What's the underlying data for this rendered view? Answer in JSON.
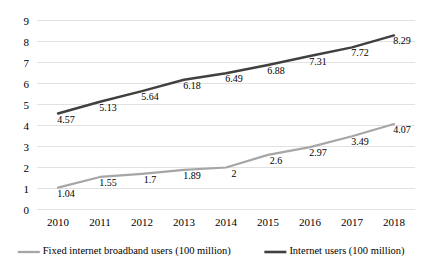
{
  "chart_data": {
    "type": "line",
    "title": "",
    "subtitle": "",
    "xlabel": "",
    "ylabel": "",
    "categories": [
      "2010",
      "2011",
      "2012",
      "2013",
      "2014",
      "2015",
      "2016",
      "2017",
      "2018"
    ],
    "ylim": [
      0,
      9
    ],
    "ytick_labels": [
      "0",
      "1",
      "2",
      "3",
      "4",
      "5",
      "6",
      "7",
      "8",
      "9"
    ],
    "ytick_values": [
      0,
      1,
      2,
      3,
      4,
      5,
      6,
      7,
      8,
      9
    ],
    "grid": "horizontal",
    "legend_position": "bottom",
    "series": [
      {
        "name": "Fixed internet broadband users (100 million)",
        "color": "#a6a6a6",
        "values": [
          1.04,
          1.55,
          1.7,
          1.89,
          2,
          2.6,
          2.97,
          3.49,
          4.07
        ],
        "labels": [
          "1.04",
          "1.55",
          "1.7",
          "1.89",
          "2",
          "2.6",
          "2.97",
          "3.49",
          "4.07"
        ]
      },
      {
        "name": "Internet users (100 million)",
        "color": "#404040",
        "values": [
          4.57,
          5.13,
          5.64,
          6.18,
          6.49,
          6.88,
          7.31,
          7.72,
          8.29
        ],
        "labels": [
          "4.57",
          "5.13",
          "5.64",
          "6.18",
          "6.49",
          "6.88",
          "7.31",
          "7.72",
          "8.29"
        ]
      }
    ]
  },
  "legend": {
    "items": [
      {
        "label": "Fixed internet broadband users (100 million)",
        "color": "#a6a6a6"
      },
      {
        "label": "Internet users (100 million)",
        "color": "#404040"
      }
    ]
  },
  "colors": {
    "background": "#ffffff",
    "gridline": "#d9d9d9",
    "text": "#000000",
    "series_light": "#a6a6a6",
    "series_dark": "#404040"
  }
}
